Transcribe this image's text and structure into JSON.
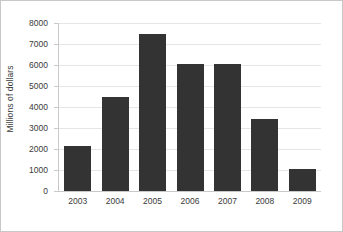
{
  "chart_data": {
    "type": "bar",
    "title": "",
    "xlabel": "",
    "ylabel": "Millions of dollars",
    "categories": [
      "2003",
      "2004",
      "2005",
      "2006",
      "2007",
      "2008",
      "2009"
    ],
    "values": [
      2150,
      4480,
      7480,
      6050,
      6050,
      3420,
      1050
    ],
    "series": [
      {
        "name": "Millions of dollars",
        "values": [
          2150,
          4480,
          7480,
          6050,
          6050,
          3420,
          1050
        ]
      }
    ],
    "ylim": [
      0,
      8000
    ],
    "y_ticks": [
      0,
      1000,
      2000,
      3000,
      4000,
      5000,
      6000,
      7000,
      8000
    ],
    "y_tick_labels": [
      "0",
      "1000",
      "2000",
      "3000",
      "4000",
      "5000",
      "6000",
      "7000",
      "8000"
    ],
    "grid": true,
    "legend": false,
    "legend_position": "none",
    "colors": {
      "bar": "#333333",
      "gridline": "#e6e6e6",
      "axis": "#c9c9c9",
      "text": "#3a3a3a",
      "background": "#ffffff",
      "border": "#c8c8c8"
    }
  }
}
